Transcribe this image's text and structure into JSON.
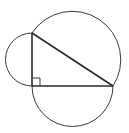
{
  "diagram": {
    "stroke_color": "#3a3a3a",
    "background": "#ffffff",
    "vertices": {
      "A": [
        32,
        33
      ],
      "C": [
        32,
        86
      ],
      "B": [
        113,
        86
      ]
    },
    "right_angle_at": "C",
    "right_angle_marker_size": 8,
    "semicircles": [
      {
        "side": "AC",
        "center": [
          32,
          59.5
        ],
        "radius": 26.5,
        "direction": "left"
      },
      {
        "side": "CB",
        "center": [
          72.5,
          86
        ],
        "radius": 40.5,
        "direction": "down"
      },
      {
        "side": "AB",
        "center": [
          72.5,
          59.5
        ],
        "radius": 48.4,
        "direction": "up-right"
      }
    ]
  }
}
